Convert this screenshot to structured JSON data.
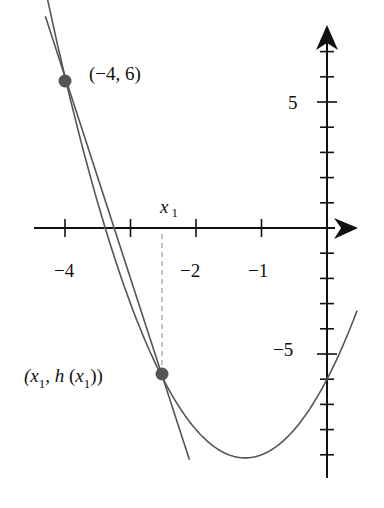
{
  "diagram": {
    "function": "h(x) = 2x^2 + 5x - 6",
    "colors": {
      "axis": "#111111",
      "curve": "#555555",
      "point": "#555555",
      "dashed": "#888888"
    },
    "x_tick_labels": [
      {
        "text": "−4",
        "value": -4
      },
      {
        "text": "−2",
        "value": -2
      },
      {
        "text": "−1",
        "value": -1
      }
    ],
    "y_tick_labels": [
      {
        "text": "5",
        "value": 5
      },
      {
        "text": "−5",
        "value": -5
      }
    ],
    "points": [
      {
        "label": "(−4, 6)",
        "x": -4,
        "y": 6
      },
      {
        "label_parts": [
          "(x",
          "1",
          ", h (x",
          "1",
          "))"
        ],
        "x": -2.5,
        "y": -6
      }
    ],
    "x1_label": {
      "main": "x",
      "sub": "1"
    },
    "secant": {
      "through": [
        [
          -4,
          6
        ],
        [
          -2.5,
          -6
        ]
      ]
    }
  },
  "chart_data": {
    "type": "line",
    "title": "",
    "xlabel": "",
    "ylabel": "",
    "xlim": [
      -4.4,
      0.4
    ],
    "ylim": [
      -10,
      8.5
    ],
    "grid": false,
    "series": [
      {
        "name": "h(x) parabola",
        "x": [
          -4.3,
          -4,
          -3.5,
          -3,
          -2.5,
          -2,
          -1.5,
          -1.25,
          -1,
          -0.5,
          0,
          0.45
        ],
        "y": [
          7.48,
          6,
          1.0,
          -3.0,
          -6.0,
          -8.0,
          -9.0,
          -9.125,
          -9.0,
          -8.0,
          -6.0,
          -3.35
        ]
      },
      {
        "name": "secant line",
        "x": [
          -4.3,
          -2.1
        ],
        "y": [
          8.4,
          -9.2
        ]
      }
    ],
    "annotations": [
      "(−4, 6)",
      "(x1, h(x1))",
      "x1"
    ],
    "x_ticks": [
      -4,
      -3,
      -2,
      -1,
      0
    ],
    "x_tick_labels": [
      "−4",
      "−2",
      "−1"
    ],
    "y_tick_labels": [
      "5",
      "−5"
    ]
  }
}
